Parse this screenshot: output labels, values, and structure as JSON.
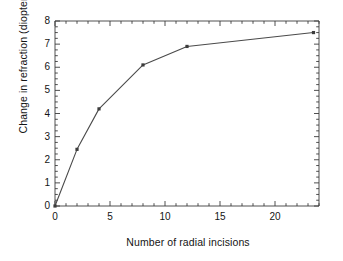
{
  "chart_data": {
    "type": "line",
    "title": "",
    "xlabel": "Number of radial incisions",
    "ylabel": "Change in refraction (diopters)",
    "xlim": [
      0,
      24
    ],
    "ylim": [
      0,
      8
    ],
    "xticks": [
      0,
      5,
      10,
      15,
      20
    ],
    "yticks": [
      0,
      1,
      2,
      3,
      4,
      5,
      6,
      7,
      8
    ],
    "xtick_labels": [
      "0",
      "5",
      "10",
      "15",
      "20"
    ],
    "ytick_labels": [
      "0",
      "1",
      "2",
      "3",
      "4",
      "5",
      "6",
      "7",
      "8"
    ],
    "minor_tick_interval_x": 1,
    "minor_tick_interval_y": 0.25,
    "grid": false,
    "legend": null,
    "marker": "square",
    "line_color": "#4a4a4a",
    "series": [
      {
        "name": "Change in refraction",
        "x": [
          0,
          2,
          4,
          8,
          12,
          23.5
        ],
        "values": [
          0,
          2.45,
          4.2,
          6.1,
          6.9,
          7.5
        ]
      }
    ]
  },
  "axes": {
    "y_axis_title": "Change in refraction (diopters)",
    "x_axis_title": "Number of radial incisions"
  }
}
